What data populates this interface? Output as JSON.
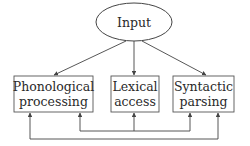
{
  "diagram": {
    "input_node": {
      "label": "Input"
    },
    "boxes": [
      {
        "line1": "Phonological",
        "line2": "processing"
      },
      {
        "line1": "Lexical",
        "line2": "access"
      },
      {
        "line1": "Syntactic",
        "line2": "parsing"
      }
    ],
    "colors": {
      "stroke": "#444444",
      "text": "#2a2a2a",
      "background": "#ffffff"
    }
  }
}
